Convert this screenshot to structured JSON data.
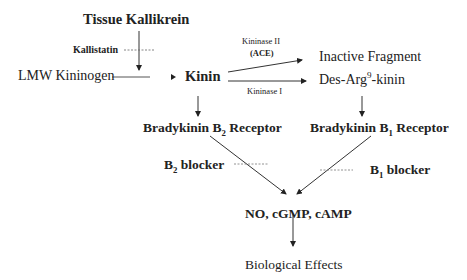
{
  "diagram": {
    "nodes": {
      "tissue_kallikrein": "Tissue Kallikrein",
      "kallistatin": "Kallistatin",
      "lmw_kininogen": "LMW Kininogen",
      "kinin": "Kinin",
      "kininase2_line1": "Kininase II",
      "kininase2_line2": "(ACE)",
      "kininase1": "Kininase I",
      "inactive_fragment": "Inactive Fragment",
      "des_arg_prefix": "Des-Arg",
      "des_arg_sup": "9",
      "des_arg_suffix": "-kinin",
      "b2_receptor_prefix": "Bradykinin B",
      "b2_receptor_sub": "2",
      "b2_receptor_suffix": " Receptor",
      "b1_receptor_prefix": "Bradykinin B",
      "b1_receptor_sub": "1",
      "b1_receptor_suffix": " Receptor",
      "b2_blocker_prefix": "B",
      "b2_blocker_sub": "2",
      "b2_blocker_suffix": " blocker",
      "b1_blocker_prefix": "B",
      "b1_blocker_sub": "1",
      "b1_blocker_suffix": " blocker",
      "messengers": "NO, cGMP, cAMP",
      "biological_effects": "Biological Effects"
    }
  }
}
